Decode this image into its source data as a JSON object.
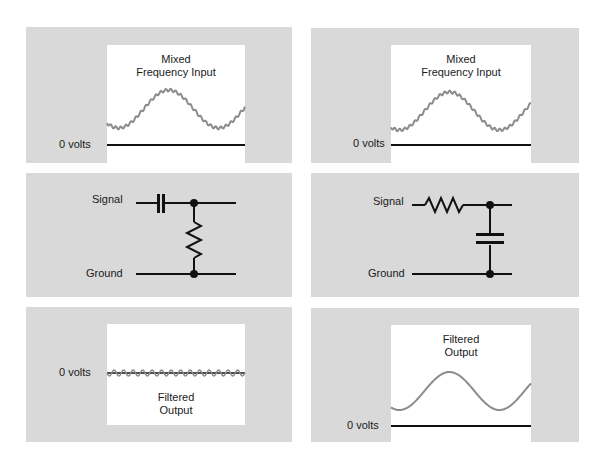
{
  "colors": {
    "panel_bg": "#d9d9d9",
    "plot_bg": "#ffffff",
    "waveform": "#8c8c8c",
    "line": "#111111"
  },
  "left_column": {
    "input_panel": {
      "title_line1": "Mixed",
      "title_line2": "Frequency Input",
      "zero_label": "0 volts"
    },
    "circuit_panel": {
      "type": "high-pass (series capacitor, shunt resistor)",
      "signal_label": "Signal",
      "ground_label": "Ground"
    },
    "output_panel": {
      "title_line1": "Filtered",
      "title_line2": "Output",
      "zero_label": "0 volts"
    }
  },
  "right_column": {
    "input_panel": {
      "title_line1": "Mixed",
      "title_line2": "Frequency Input",
      "zero_label": "0 volts"
    },
    "circuit_panel": {
      "type": "low-pass (series resistor, shunt capacitor)",
      "signal_label": "Signal",
      "ground_label": "Ground"
    },
    "output_panel": {
      "title_line1": "Filtered",
      "title_line2": "Output",
      "zero_label": "0 volts"
    }
  }
}
